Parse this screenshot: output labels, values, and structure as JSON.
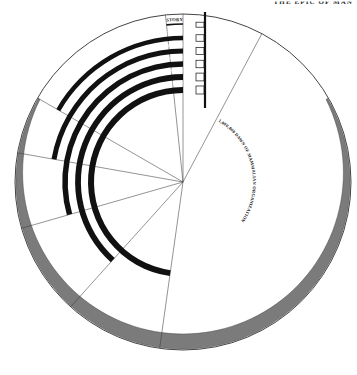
{
  "page": {
    "corner_title": "THE EPIC OF MAN",
    "background_color": "#ffffff"
  },
  "diagram": {
    "center": {
      "x": 183,
      "y": 182
    },
    "outer_circle_radius": 168,
    "colors": {
      "ink": "#111111",
      "gray_band": "#7b7b7b",
      "hairline": "#3a3a3a",
      "paper": "#ffffff"
    },
    "bands": [
      {
        "name": "recorded-history",
        "label": "3000 B.C. RECORDED HISTORY",
        "radius": 158,
        "thickness": 1.6,
        "fill": "#111111",
        "start_deg": -90,
        "end_deg": -96
      },
      {
        "name": "reindeer-age",
        "label": "12,000 END OF REINDEER AGE",
        "radius": 144,
        "thickness": 4.5,
        "fill": "#111111",
        "start_deg": -90,
        "end_deg": -150
      },
      {
        "name": "neanderthal-man",
        "label": "100,000 NEANDERTHAL MAN",
        "radius": 131,
        "thickness": 5.0,
        "fill": "#111111",
        "start_deg": -90,
        "end_deg": -170
      },
      {
        "name": "pithecanthropus",
        "label": "500,000 PITHECANTHROPUS",
        "radius": 118,
        "thickness": 5.5,
        "fill": "#111111",
        "start_deg": -90,
        "end_deg": -196
      },
      {
        "name": "australopithecus",
        "label": "900,000 AUSTRALOPITHECUS",
        "radius": 105,
        "thickness": 5.8,
        "fill": "#111111",
        "start_deg": -90,
        "end_deg": -228
      },
      {
        "name": "anthropoid-stem",
        "label": "1,000,000 ANTHROPOID STEM",
        "radius": 92,
        "thickness": 6.0,
        "fill": "#111111",
        "start_deg": -90,
        "end_deg": -262
      }
    ],
    "gray_crescent": {
      "name": "mammalian-era-crescent",
      "outer_radius": 167,
      "inner_radius": 152,
      "start_deg": -150,
      "end_deg": -390,
      "fill": "#7b7b7b"
    },
    "curved_label": {
      "name": "mammalian-dawn",
      "text": "1,000,000 DAWN OF MAMMALIAN ORGANIZATION",
      "radius": 70,
      "start_deg": -62
    },
    "radial_lines": [
      {
        "name": "radial-90",
        "angle_deg": -90,
        "length": 168
      },
      {
        "name": "radial-96",
        "angle_deg": -96,
        "length": 168
      },
      {
        "name": "radial-150",
        "angle_deg": -150,
        "length": 168
      },
      {
        "name": "radial-170",
        "angle_deg": -170,
        "length": 168
      },
      {
        "name": "radial-196",
        "angle_deg": -196,
        "length": 168
      },
      {
        "name": "radial-228",
        "angle_deg": -228,
        "length": 168
      },
      {
        "name": "radial-262",
        "angle_deg": -262,
        "length": 168
      },
      {
        "name": "radial-62",
        "angle_deg": -62,
        "length": 168
      }
    ],
    "tick_count": 6
  }
}
